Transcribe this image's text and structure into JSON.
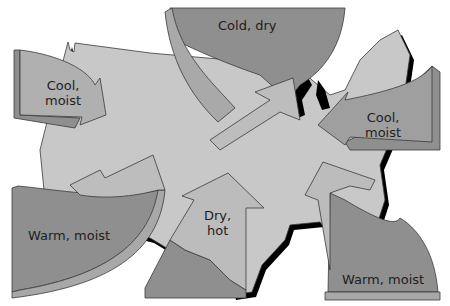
{
  "diagram": {
    "colors": {
      "land": "#c4c4c4",
      "source_region": "#8c8c8c",
      "source_edge": "#a8a8a8",
      "arrow": "#b4b4b4",
      "shadow": "#000000",
      "outline": "#3a3a3a"
    },
    "air_masses": [
      {
        "id": "cold-dry",
        "label": "Cold, dry"
      },
      {
        "id": "cool-moist-west",
        "label_line1": "Cool,",
        "label_line2": "moist"
      },
      {
        "id": "cool-moist-east",
        "label_line1": "Cool,",
        "label_line2": "moist"
      },
      {
        "id": "warm-moist-west",
        "label": "Warm, moist"
      },
      {
        "id": "dry-hot",
        "label_line1": "Dry,",
        "label_line2": "hot"
      },
      {
        "id": "warm-moist-east",
        "label": "Warm, moist"
      }
    ]
  }
}
